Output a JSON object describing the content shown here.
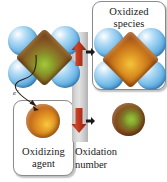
{
  "figure": {
    "background_color": "#ffffff"
  },
  "callouts": [
    {
      "id": "oxidized-species",
      "label": "Oxidized\nspecies",
      "line1": "Oxidized",
      "line2": "species"
    },
    {
      "id": "oxidizing-agent",
      "label": "Oxidizing\nagent",
      "line1": "Oxidizing",
      "line2": "agent"
    }
  ],
  "labels": {
    "oxidation_number_line1": "Oxidation",
    "oxidation_number_line2": "number",
    "electron": "e",
    "electron_charge": "−"
  },
  "molecules": [
    {
      "id": "reduced-complex",
      "core_state": "reduced",
      "core_colors": [
        "#a8c63a",
        "#8a6a26",
        "#5a2d12"
      ],
      "ligand_count": 4,
      "ligand_color": "#7cc0ea"
    },
    {
      "id": "oxidized-complex",
      "core_state": "oxidized",
      "core_colors": [
        "#f2c43c",
        "#d78a20",
        "#8a3d14"
      ],
      "ligand_count": 4,
      "ligand_color": "#7cc0ea"
    }
  ],
  "spheres": [
    {
      "id": "oxidizing-agent-sphere",
      "state": "oxidized",
      "colors": [
        "#f6c83e",
        "#d9851f",
        "#7d3312"
      ]
    },
    {
      "id": "reduced-product-sphere",
      "state": "reduced",
      "colors": [
        "#9fc23a",
        "#86501f",
        "#54210e"
      ]
    }
  ],
  "scale_bar": {
    "id": "oxidation-number-bar",
    "colors": [
      "#bdbdbd",
      "#e2e2e2",
      "#b2b2b2"
    ],
    "arrows": [
      {
        "id": "increase",
        "direction": "up",
        "color": "#c0351d",
        "meaning": "oxidation number increases"
      },
      {
        "id": "decrease",
        "direction": "down",
        "color": "#c0351d",
        "meaning": "oxidation number decreases"
      }
    ]
  },
  "annotations": {
    "electron_transfer_arrow_color": "#2b1a12",
    "pointer_arrow_color": "#1a1a1a"
  },
  "colors": {
    "ligand_blue": "#7cc0ea",
    "core_reduced_green": "#a8c63a",
    "core_oxidized_orange": "#d78a20",
    "arrow_red": "#c0351d",
    "bar_gray": "#d6d6d6",
    "box_border": "#8a8a8a",
    "text": "#1a1a1a"
  }
}
